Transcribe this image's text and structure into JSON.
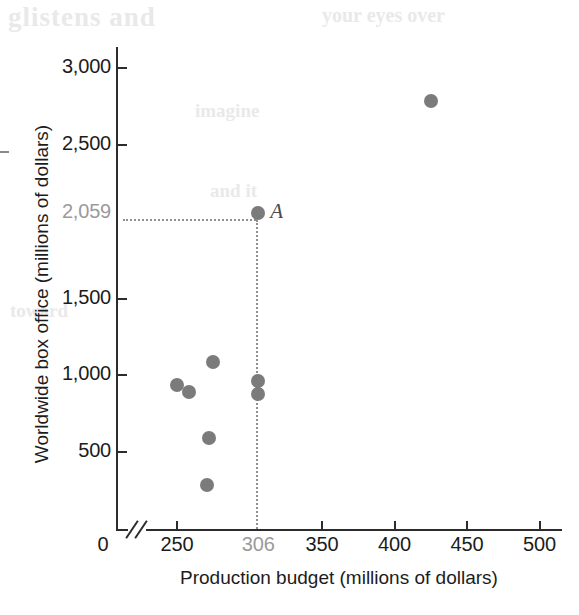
{
  "chart_data": {
    "type": "scatter",
    "title": "",
    "xlabel": "Production budget (millions of dollars)",
    "ylabel": "Worldwide box office (millions of dollars)",
    "xlim": [
      225,
      500
    ],
    "ylim": [
      0,
      3100
    ],
    "x_ticks": [
      "250",
      "306",
      "350",
      "400",
      "450",
      "500"
    ],
    "x_tick_values": [
      250,
      306,
      350,
      400,
      450,
      500
    ],
    "y_ticks": [
      "500",
      "1,000",
      "1,500",
      "2,059",
      "2,500",
      "3,000"
    ],
    "y_tick_values": [
      500,
      1000,
      1500,
      2059,
      2500,
      3000
    ],
    "x_origin_label": "0",
    "x_axis_break": true,
    "grid": false,
    "legend": null,
    "highlighted_ticks": [
      "306",
      "2,059"
    ],
    "points": [
      {
        "x": 250,
        "y": 935,
        "label": ""
      },
      {
        "x": 258,
        "y": 890,
        "label": ""
      },
      {
        "x": 275,
        "y": 1085,
        "label": ""
      },
      {
        "x": 272,
        "y": 590,
        "label": ""
      },
      {
        "x": 271,
        "y": 285,
        "label": ""
      },
      {
        "x": 306,
        "y": 965,
        "label": ""
      },
      {
        "x": 306,
        "y": 880,
        "label": ""
      },
      {
        "x": 306,
        "y": 2059,
        "label": "A"
      },
      {
        "x": 425,
        "y": 2785,
        "label": ""
      }
    ],
    "annotations": [
      {
        "point_label": "A",
        "x": 306,
        "y": 2059,
        "guide_lines": [
          "horizontal-to-y-axis",
          "vertical-to-x-axis"
        ]
      }
    ],
    "colors": {
      "point": "#7b7b7b",
      "axis": "#2c2c2c",
      "text": "#1c1c1c",
      "highlight_text": "#9a9a9a",
      "guide": "#8f8f8f"
    }
  },
  "ghost_text": {
    "line1": "glistens and",
    "line2": "your eyes over",
    "line3": "imagine",
    "line4": "and it",
    "line5": "toward"
  }
}
